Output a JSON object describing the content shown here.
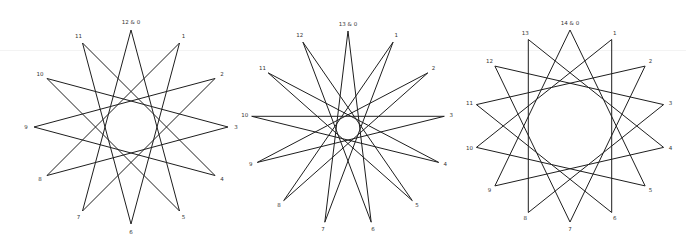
{
  "colors": {
    "background": "#ffffff",
    "line": "#1e1e1e",
    "label": "#333333"
  },
  "stars": [
    {
      "name": "star-12",
      "points": 12,
      "step": 5,
      "center": [
        131,
        127
      ],
      "radius": 97,
      "label_offset": 8,
      "top_label": "12 & 0",
      "labels": [
        "12 & 0",
        "1",
        "2",
        "3",
        "4",
        "5",
        "6",
        "7",
        "8",
        "9",
        "10",
        "11"
      ]
    },
    {
      "name": "star-13",
      "points": 13,
      "step": 6,
      "center": [
        348,
        128
      ],
      "radius": 97,
      "label_offset": 7,
      "top_label": "13 & 0",
      "labels": [
        "13 & 0",
        "1",
        "2",
        "3",
        "4",
        "5",
        "6",
        "7",
        "8",
        "9",
        "10",
        "11",
        "12"
      ]
    },
    {
      "name": "star-14",
      "points": 14,
      "step": 5,
      "center": [
        570,
        126
      ],
      "radius": 96,
      "label_offset": 7,
      "top_label": "14 & 0",
      "labels": [
        "14 & 0",
        "1",
        "2",
        "3",
        "4",
        "5",
        "6",
        "7",
        "8",
        "9",
        "10",
        "11",
        "12",
        "13"
      ]
    }
  ]
}
